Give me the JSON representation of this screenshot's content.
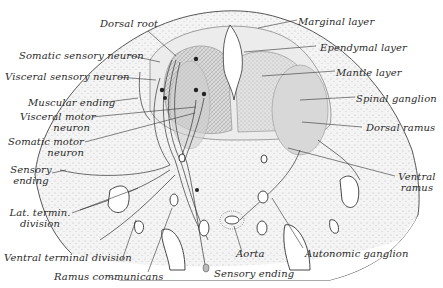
{
  "figure": {
    "type": "anatomical-cross-section",
    "colors": {
      "ink": "#2a2a2a",
      "stipple": "#8a8a8a",
      "tissue_light": "#e6e6e6",
      "tissue_mid": "#cfcfcf",
      "background": "#ffffff"
    }
  },
  "labels": {
    "left": [
      {
        "id": "dorsal-root",
        "text": "Dorsal root"
      },
      {
        "id": "somatic-sensory-neuron",
        "text": "Somatic sensory neuron"
      },
      {
        "id": "visceral-sensory-neuron",
        "text": "Visceral sensory neuron"
      },
      {
        "id": "muscular-ending",
        "text": "Muscular ending"
      },
      {
        "id": "visceral-motor-neuron",
        "text": "Visceral motor",
        "text2": "neuron"
      },
      {
        "id": "somatic-motor-neuron",
        "text": "Somatic motor",
        "text2": "neuron"
      },
      {
        "id": "sensory-ending-left",
        "text": "Sensory",
        "text2": "ending"
      },
      {
        "id": "lat-termin-division",
        "text": "Lat. termin.",
        "text2": "division"
      },
      {
        "id": "ventral-terminal-division",
        "text": "Ventral terminal division"
      },
      {
        "id": "ramus-communicans",
        "text": "Ramus communicans"
      }
    ],
    "right": [
      {
        "id": "marginal-layer",
        "text": "Marginal layer"
      },
      {
        "id": "ependymal-layer",
        "text": "Ependymal layer"
      },
      {
        "id": "mantle-layer",
        "text": "Mantle layer"
      },
      {
        "id": "spinal-ganglion",
        "text": "Spinal ganglion"
      },
      {
        "id": "dorsal-ramus",
        "text": "Dorsal ramus"
      },
      {
        "id": "ventral-ramus",
        "text": "Ventral",
        "text2": "ramus"
      }
    ],
    "bottom": [
      {
        "id": "aorta",
        "text": "Aorta"
      },
      {
        "id": "autonomic-ganglion",
        "text": "Autonomic ganglion"
      },
      {
        "id": "sensory-ending-bottom",
        "text": "Sensory ending"
      }
    ]
  }
}
